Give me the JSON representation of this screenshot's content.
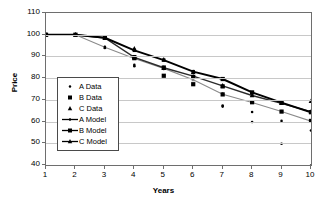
{
  "chart_data": {
    "type": "scatter",
    "title": "",
    "xlabel": "Years",
    "ylabel": "Price",
    "xlim": [
      1,
      10
    ],
    "ylim": [
      40,
      110
    ],
    "yticks": [
      110,
      100,
      90,
      80,
      70,
      60,
      50,
      40
    ],
    "xticks": [
      1,
      2,
      3,
      4,
      5,
      6,
      7,
      8,
      9,
      10
    ],
    "grid": "horizontal",
    "legend_position": "center-left",
    "x": [
      1,
      2,
      3,
      4,
      5,
      6,
      7,
      8,
      9,
      10
    ],
    "series": [
      {
        "name": "A Model",
        "kind": "line",
        "marker": "diamond",
        "color": "#8a8a8a",
        "values": [
          100.0,
          100.0,
          94.2,
          89.0,
          84.5,
          79.3,
          72.6,
          68.8,
          64.6,
          60.2
        ]
      },
      {
        "name": "B Model",
        "kind": "line",
        "marker": "square",
        "color": "#000000",
        "values": [
          100.0,
          100.0,
          98.6,
          92.8,
          88.3,
          83.0,
          79.6,
          73.4,
          68.7,
          64.3
        ]
      },
      {
        "name": "C Model",
        "kind": "line",
        "marker": "triangle",
        "color": "#2b2b2b",
        "values": [
          100.0,
          100.0,
          98.5,
          89.6,
          84.8,
          80.9,
          76.4,
          72.0,
          68.4,
          64.5
        ]
      },
      {
        "name": "A Data",
        "kind": "scatter",
        "marker": "dot",
        "color": "#000000",
        "points": [
          [
            1,
            100.0
          ],
          [
            2,
            100.0
          ],
          [
            3,
            94.4
          ],
          [
            3,
            93.9
          ],
          [
            4,
            86.1
          ],
          [
            4,
            85.5
          ],
          [
            4,
            89.4
          ],
          [
            5,
            84.2
          ],
          [
            5,
            81.2
          ],
          [
            6,
            80.3
          ],
          [
            6,
            77.1
          ],
          [
            7,
            72.8
          ],
          [
            7,
            67.4
          ],
          [
            7,
            66.9
          ],
          [
            8,
            68.9
          ],
          [
            8,
            64.4
          ],
          [
            8,
            59.8
          ],
          [
            9,
            64.6
          ],
          [
            9,
            60.3
          ],
          [
            9,
            49.8
          ],
          [
            10,
            60.4
          ],
          [
            10,
            55.9
          ],
          [
            10,
            39.8
          ]
        ]
      },
      {
        "name": "B Data",
        "kind": "scatter",
        "marker": "square",
        "color": "#000000",
        "points": [
          [
            1,
            100.0
          ],
          [
            2,
            100.0
          ],
          [
            3,
            98.6
          ],
          [
            4,
            89.7
          ],
          [
            4,
            89.2
          ],
          [
            5,
            84.9
          ],
          [
            5,
            81.1
          ],
          [
            6,
            80.6
          ],
          [
            6,
            77.2
          ],
          [
            7,
            79.6
          ],
          [
            7,
            76.2
          ],
          [
            7,
            72.5
          ],
          [
            8,
            73.4
          ],
          [
            8,
            68.9
          ],
          [
            9,
            68.7
          ],
          [
            9,
            64.6
          ],
          [
            10,
            64.3
          ],
          [
            10,
            60.3
          ]
        ]
      },
      {
        "name": "C Data",
        "kind": "scatter",
        "marker": "triangle",
        "color": "#000000",
        "points": [
          [
            1,
            100.0
          ],
          [
            2,
            100.0
          ],
          [
            3,
            98.4
          ],
          [
            4,
            93.6
          ],
          [
            4,
            89.5
          ],
          [
            5,
            88.5
          ],
          [
            5,
            84.6
          ],
          [
            6,
            82.8
          ],
          [
            6,
            80.4
          ],
          [
            7,
            76.5
          ],
          [
            8,
            72.0
          ],
          [
            9,
            68.5
          ],
          [
            10,
            69.4
          ],
          [
            10,
            64.6
          ]
        ]
      }
    ]
  },
  "legend": {
    "items": [
      {
        "label": "A Data",
        "marker": "dot-marker",
        "line": false
      },
      {
        "label": "B Data",
        "marker": "square-marker",
        "line": false
      },
      {
        "label": "C Data",
        "marker": "triangle-marker",
        "line": false
      },
      {
        "label": "A Model",
        "marker": "dot-marker",
        "line": true
      },
      {
        "label": "B Model",
        "marker": "square-marker",
        "line": true
      },
      {
        "label": "C Model",
        "marker": "triangle-marker",
        "line": true
      }
    ]
  }
}
